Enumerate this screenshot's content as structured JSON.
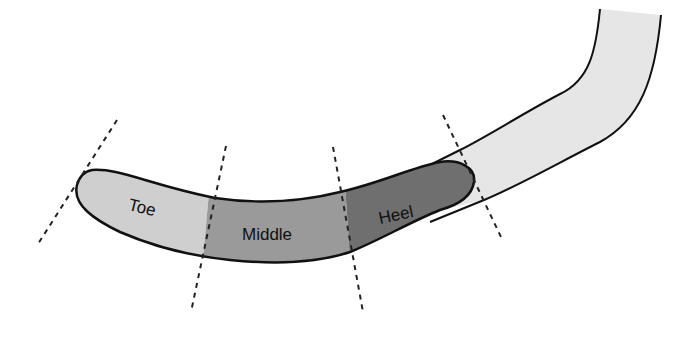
{
  "diagram": {
    "zones": [
      {
        "name": "toe",
        "label": "Toe",
        "color": "#cfcfcf"
      },
      {
        "name": "middle",
        "label": "Middle",
        "color": "#9a9a9a"
      },
      {
        "name": "heel",
        "label": "Heel",
        "color": "#6f6f6f"
      }
    ],
    "shaft_color": "#e6e6e6",
    "outline_color": "#111111",
    "divider_style": "dashed",
    "divider_count": 4
  }
}
